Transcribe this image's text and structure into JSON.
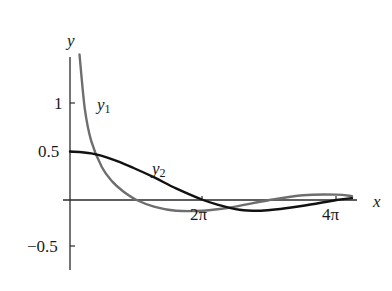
{
  "chart_data": {
    "type": "line",
    "title": "",
    "xlabel": "x",
    "ylabel": "y",
    "x_ticks": [
      {
        "value": 6.283,
        "label": "2π"
      },
      {
        "value": 12.566,
        "label": "4π"
      }
    ],
    "y_ticks": [
      {
        "value": 1,
        "label": "1"
      },
      {
        "value": 0.5,
        "label": "0.5"
      },
      {
        "value": -0.5,
        "label": "-0.5"
      }
    ],
    "xlim": [
      0,
      13.5
    ],
    "ylim": [
      -0.75,
      1.5
    ],
    "grid": false,
    "legend": "inline labels",
    "series": [
      {
        "name": "y1",
        "label": "y",
        "subscript": "1",
        "color": "#6e6e6e",
        "x": [
          0.45,
          0.7,
          1.0,
          1.5,
          2.0,
          2.5,
          3.14,
          4.0,
          5.0,
          6.28,
          7.5,
          9.42,
          11.0,
          12.57,
          13.3
        ],
        "y": [
          1.5,
          0.94,
          0.61,
          0.34,
          0.19,
          0.09,
          0.0,
          -0.07,
          -0.11,
          -0.11,
          -0.08,
          0.0,
          0.05,
          0.056,
          0.04
        ]
      },
      {
        "name": "y2",
        "label": "y",
        "subscript": "2",
        "color": "#111111",
        "x": [
          0,
          1,
          2,
          3,
          4,
          5,
          6.28,
          7,
          8,
          9,
          10,
          11,
          12.57,
          13.3
        ],
        "y": [
          0.5,
          0.48,
          0.42,
          0.33,
          0.23,
          0.12,
          0.0,
          -0.05,
          -0.1,
          -0.11,
          -0.09,
          -0.06,
          0.0,
          0.02
        ]
      }
    ]
  },
  "labels": {
    "y_axis": "y",
    "x_axis": "x",
    "tick_1": "1",
    "tick_05": "0.5",
    "tick_m05": "−0.5",
    "tick_2pi": "2π",
    "tick_4pi": "4π",
    "y1_base": "y",
    "y1_sub": "1",
    "y2_base": "y",
    "y2_sub": "2"
  }
}
